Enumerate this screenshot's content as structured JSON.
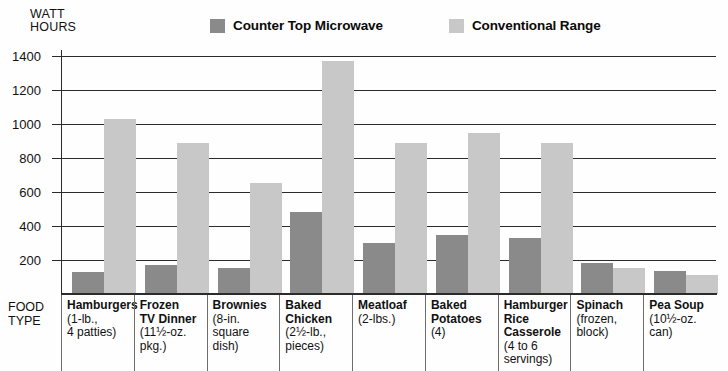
{
  "axis_title": {
    "line1": "WATT",
    "line2": "HOURS"
  },
  "legend": {
    "entries": [
      {
        "label": "Counter Top Microwave",
        "color": "#8a8a8a",
        "icon": "square-swatch-dark"
      },
      {
        "label": "Conventional Range",
        "color": "#c8c8c8",
        "icon": "square-swatch-light"
      }
    ]
  },
  "food_type_label": {
    "line1": "FOOD",
    "line2": "TYPE"
  },
  "chart_data": {
    "type": "bar",
    "title": "",
    "xlabel": "FOOD TYPE",
    "ylabel": "WATT HOURS",
    "ylim": [
      0,
      1400
    ],
    "ytick_labels": [
      "1400",
      "1200",
      "1000",
      "800",
      "600",
      "400",
      "200"
    ],
    "yticks": [
      1400,
      1200,
      1000,
      800,
      600,
      400,
      200
    ],
    "grid": true,
    "legend_position": "top",
    "categories": [
      "Hamburgers",
      "Frozen TV Dinner",
      "Brownies",
      "Baked Chicken",
      "Meatloaf",
      "Baked Potatoes",
      "Hamburger Rice Casserole",
      "Spinach",
      "Pea Soup"
    ],
    "category_details": [
      {
        "name": "Hamburgers",
        "sub": "(1-lb.,\n4 patties)"
      },
      {
        "name": "Frozen\nTV Dinner",
        "sub": "(11½-oz.\npkg.)"
      },
      {
        "name": "Brownies",
        "sub": "(8-in.\nsquare\ndish)"
      },
      {
        "name": "Baked\nChicken",
        "sub": "(2½-lb.,\npieces)"
      },
      {
        "name": "Meatloaf",
        "sub": "(2-lbs.)"
      },
      {
        "name": "Baked\nPotatoes",
        "sub": "(4)"
      },
      {
        "name": "Hamburger\nRice\nCasserole",
        "sub": "(4 to 6\nservings)"
      },
      {
        "name": "Spinach",
        "sub": "(frozen,\nblock)"
      },
      {
        "name": "Pea Soup",
        "sub": "(10½-oz.\ncan)"
      }
    ],
    "series": [
      {
        "name": "Counter Top Microwave",
        "color": "#8a8a8a",
        "values": [
          130,
          170,
          155,
          480,
          300,
          345,
          330,
          180,
          135
        ]
      },
      {
        "name": "Conventional Range",
        "color": "#c8c8c8",
        "values": [
          1030,
          890,
          655,
          1370,
          890,
          945,
          890,
          155,
          110
        ]
      }
    ]
  }
}
